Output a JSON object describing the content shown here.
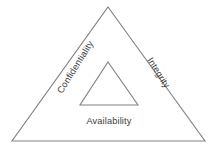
{
  "diagram": {
    "name": "CIA Triad",
    "type": "nested-triangle-diagram",
    "background_color": "#ffffff",
    "stroke_color": "#808080",
    "text_color": "#3a3a3a",
    "outer_triangle": {
      "label": "outer-triangle",
      "apex": [
        108,
        7
      ],
      "bottom_left": [
        12,
        141
      ],
      "bottom_right": [
        205,
        141
      ]
    },
    "inner_triangle": {
      "label": "inner-triangle",
      "apex": [
        108,
        62
      ],
      "bottom_left": [
        80,
        105
      ],
      "bottom_right": [
        138,
        105
      ]
    },
    "labels": {
      "confidentiality": {
        "text": "Confidentiality",
        "rotation_deg": -58,
        "x": 62,
        "y": 94
      },
      "integrity": {
        "text": "Integrity",
        "rotation_deg": 58,
        "x": 147,
        "y": 60
      },
      "availability": {
        "text": "Availability",
        "rotation_deg": 0,
        "x": 109,
        "y": 124
      }
    }
  }
}
